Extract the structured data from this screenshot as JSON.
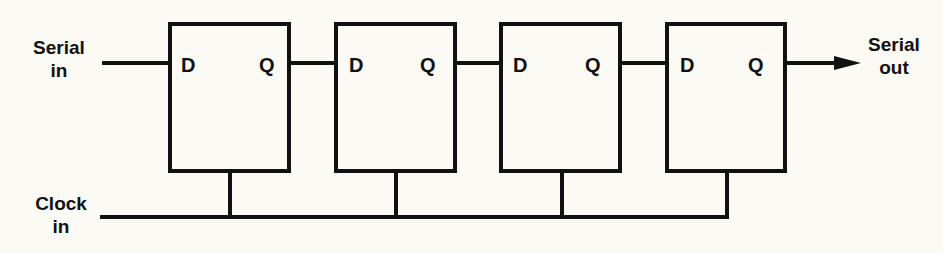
{
  "diagram": {
    "inputs": {
      "serial_in": [
        "Serial",
        "in"
      ],
      "clock_in": [
        "Clock",
        "in"
      ]
    },
    "outputs": {
      "serial_out": [
        "Serial",
        "out"
      ]
    },
    "flip_flops": [
      {
        "input_label": "D",
        "output_label": "Q"
      },
      {
        "input_label": "D",
        "output_label": "Q"
      },
      {
        "input_label": "D",
        "output_label": "Q"
      },
      {
        "input_label": "D",
        "output_label": "Q"
      }
    ],
    "colors": {
      "line": "#111111",
      "background": "#fbfaf4"
    }
  }
}
